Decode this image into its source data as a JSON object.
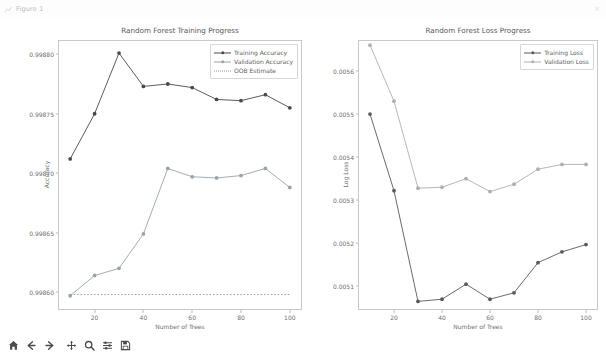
{
  "window": {
    "title": "Figure 1",
    "icon": "chart-icon",
    "close_label": "×"
  },
  "toolbar": {
    "buttons": [
      {
        "name": "home-button",
        "icon": "home-icon",
        "tooltip": "Reset original view"
      },
      {
        "name": "back-button",
        "icon": "arrow-left-icon",
        "tooltip": "Back to previous view"
      },
      {
        "name": "forward-button",
        "icon": "arrow-right-icon",
        "tooltip": "Forward to next view"
      },
      {
        "name": "pan-button",
        "icon": "move-icon",
        "tooltip": "Pan axes with left mouse, zoom with right"
      },
      {
        "name": "zoom-button",
        "icon": "magnifier-icon",
        "tooltip": "Zoom to rectangle"
      },
      {
        "name": "subplots-button",
        "icon": "sliders-icon",
        "tooltip": "Configure subplots"
      },
      {
        "name": "save-button",
        "icon": "save-icon",
        "tooltip": "Save the figure"
      }
    ]
  },
  "colors": {
    "training": "#4a4a4a",
    "validation": "#9aa3ad",
    "oob": "#8f9aa6",
    "training_loss": "#5a5a5a",
    "validation_loss": "#a8b0b8",
    "axis": "#c9c9c9",
    "text": "#5e6063"
  },
  "chart_data": [
    {
      "type": "line",
      "id": "training-progress",
      "title": "Random Forest Training Progress",
      "xlabel": "Number of Trees",
      "ylabel": "Accuracy",
      "x": [
        10,
        20,
        30,
        40,
        50,
        60,
        70,
        80,
        90,
        100
      ],
      "xlim": [
        5,
        105
      ],
      "ylim": [
        0.998585,
        0.998812
      ],
      "xticks": [
        20,
        40,
        60,
        80,
        100
      ],
      "yticks": [
        0.9986,
        0.99865,
        0.9987,
        0.99875,
        0.9988
      ],
      "ytick_labels": [
        "0.99860",
        "0.99865",
        "0.99870",
        "0.99875",
        "0.99880"
      ],
      "grid": false,
      "legend_position": "upper right",
      "series": [
        {
          "name": "Training Accuracy",
          "marker": "circle",
          "linestyle": "solid",
          "color": "#4a4a4a",
          "values": [
            0.998712,
            0.99875,
            0.998801,
            0.998773,
            0.998775,
            0.998772,
            0.998762,
            0.998761,
            0.998766,
            0.998755
          ]
        },
        {
          "name": "Validation Accuracy",
          "marker": "circle",
          "linestyle": "solid",
          "color": "#9aa3ad",
          "values": [
            0.998597,
            0.998614,
            0.99862,
            0.998649,
            0.998704,
            0.998697,
            0.998696,
            0.998698,
            0.998704,
            0.998688
          ]
        },
        {
          "name": "OOB Estimate",
          "marker": "none",
          "linestyle": "dotted",
          "color": "#8f9aa6",
          "values": [
            0.998598,
            0.998598,
            0.998598,
            0.998598,
            0.998598,
            0.998598,
            0.998598,
            0.998598,
            0.998598,
            0.998598
          ]
        }
      ]
    },
    {
      "type": "line",
      "id": "loss-progress",
      "title": "Random Forest Loss Progress",
      "xlabel": "Number of Trees",
      "ylabel": "Log Loss",
      "x": [
        10,
        20,
        30,
        40,
        50,
        60,
        70,
        80,
        90,
        100
      ],
      "xlim": [
        5,
        105
      ],
      "ylim": [
        0.005045,
        0.005672
      ],
      "xticks": [
        20,
        40,
        60,
        80,
        100
      ],
      "yticks": [
        0.0051,
        0.0052,
        0.0053,
        0.0054,
        0.0055,
        0.0056
      ],
      "ytick_labels": [
        "0.0051",
        "0.0052",
        "0.0053",
        "0.0054",
        "0.0055",
        "0.0056"
      ],
      "grid": false,
      "legend_position": "upper right",
      "series": [
        {
          "name": "Training Loss",
          "marker": "circle",
          "linestyle": "solid",
          "color": "#5a5a5a",
          "values": [
            0.0055,
            0.005322,
            0.005065,
            0.00507,
            0.005105,
            0.00507,
            0.005085,
            0.005155,
            0.00518,
            0.005197
          ]
        },
        {
          "name": "Validation Loss",
          "marker": "circle",
          "linestyle": "solid",
          "color": "#a8b0b8",
          "values": [
            0.00566,
            0.00553,
            0.005328,
            0.00533,
            0.00535,
            0.00532,
            0.005337,
            0.005372,
            0.005383,
            0.005383
          ]
        }
      ]
    }
  ]
}
